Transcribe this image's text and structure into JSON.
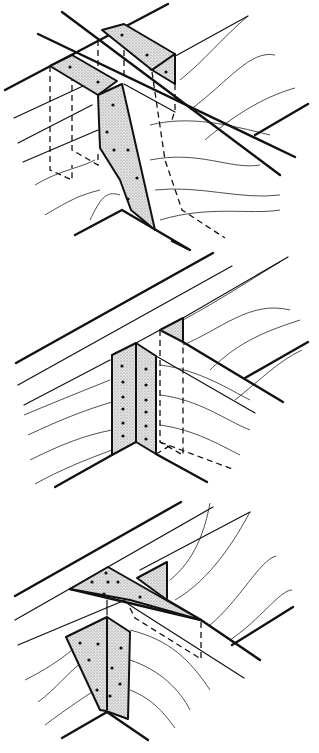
{
  "figure": {
    "colors": {
      "line": "#111111",
      "plate_fill": "#d8d8d8",
      "background": "#ffffff"
    },
    "panels": [
      {
        "name": "joist-hanger-detail",
        "label": "",
        "plates": [
          "M50,66 L72,55 L117,81 L98,95 Z",
          "M102,30 L124,24 L175,54 L152,70 Z",
          "M152,70 L175,54 L175,84 Z",
          "M98,95 L122,84 L155,230 L131,210 L120,180 L100,148 Z"
        ],
        "nails": [
          [
            70,
            67
          ],
          [
            98,
            82
          ],
          [
            122,
            35
          ],
          [
            147,
            55
          ],
          [
            166,
            72
          ],
          [
            113,
            105
          ],
          [
            107,
            132
          ],
          [
            114,
            150
          ],
          [
            128,
            150
          ],
          [
            137,
            178
          ],
          [
            128,
            199
          ]
        ],
        "thick_lines": [
          "M5,90 L168,4",
          "M38,34 L295,157",
          "M62,12 L280,175",
          "M255,135 L308,104",
          "M75,235 L122,210 L190,250"
        ],
        "thin_lines": [
          "M14,118 L96,80",
          "M18,143 L92,105",
          "M23,162 L98,130",
          "M150,70 L248,16",
          "M124,84 L175,112"
        ],
        "dashed_lines": [
          "M50,66 L50,170 L72,180 L72,165",
          "M72,55 L72,150 L98,165 L98,150",
          "M98,40 L98,90",
          "M124,30 L124,80",
          "M152,72 L165,160 L182,210 L225,238",
          "M175,84 L175,110 L172,120"
        ],
        "grain_lines": [
          "M180,80 C205,60 220,40 248,16",
          "M190,110 C230,80 250,50 275,55",
          "M205,140 C240,110 270,95 295,88",
          "M150,125 C190,115 230,125 270,135",
          "M150,160 C200,150 230,170 260,165",
          "M155,190 C200,185 240,200 280,195",
          "M160,220 C210,205 250,215 280,210",
          "M90,220 C100,200 105,190 120,195",
          "M35,185 C60,170 80,168 95,160",
          "M45,215 C70,200 80,195 100,190"
        ]
      },
      {
        "name": "angle-connector-detail",
        "label": "",
        "plates": [
          "M112,355 L136,343 L136,442 L112,455 Z",
          "M136,343 L156,356 L156,454 L136,442 Z",
          "M160,330 L183,318 L183,342 Z"
        ],
        "nails": [
          [
            122,
            366
          ],
          [
            123,
            382
          ],
          [
            123,
            397
          ],
          [
            123,
            409
          ],
          [
            123,
            423
          ],
          [
            123,
            436
          ],
          [
            146,
            369
          ],
          [
            146,
            385
          ],
          [
            146,
            400
          ],
          [
            146,
            412
          ],
          [
            146,
            426
          ],
          [
            146,
            439
          ]
        ],
        "thick_lines": [
          "M16,363 L213,253",
          "M245,378 L308,342",
          "M55,487 L112,455",
          "M156,454 L207,482",
          "M183,342 L283,402",
          "M172,241 L188,249"
        ],
        "thin_lines": [
          "M18,385 L232,266",
          "M24,405 L110,360",
          "M136,343 L160,330 L183,318 L288,257",
          "M156,356 L255,413"
        ],
        "dashed_lines": [
          "M160,330 L160,442 L183,455 L183,342",
          "M160,442 L235,470",
          "M156,454 L173,444"
        ],
        "grain_lines": [
          "M183,320 C220,300 250,280 280,262",
          "M183,345 C220,330 250,300 290,310",
          "M210,370 C240,340 270,330 300,320",
          "M235,400 C260,380 280,360 302,350",
          "M160,365 C200,370 230,390 250,400",
          "M160,395 C200,400 225,420 250,430",
          "M160,425 C195,430 220,445 240,455",
          "M24,415 C60,400 85,390 110,380",
          "M28,435 C60,420 85,410 112,402",
          "M30,460 C60,445 85,435 112,430",
          "M35,484 C60,470 85,460 112,450"
        ]
      },
      {
        "name": "gusset-plate-detail",
        "label": "",
        "plates": [
          "M70,589 L108,567 L201,620 L130,600 Z",
          "M137,578 L167,562 L167,600 Z",
          "M66,637 L107,617 L130,632 L128,719 L106,711 L100,710 Z",
          "M107,617 L107,710"
        ],
        "nails": [
          [
            92,
            582
          ],
          [
            106,
            573
          ],
          [
            108,
            582
          ],
          [
            118,
            582
          ],
          [
            104,
            594
          ],
          [
            140,
            597
          ],
          [
            80,
            643
          ],
          [
            98,
            644
          ],
          [
            121,
            648
          ],
          [
            112,
            668
          ],
          [
            89,
            660
          ],
          [
            97,
            690
          ],
          [
            120,
            684
          ],
          [
            110,
            696
          ]
        ],
        "thick_lines": [
          "M15,596 L181,502",
          "M232,645 L293,607",
          "M62,738 L107,712 L148,740",
          "M167,600 L201,620 L260,660",
          "M70,589 L201,620"
        ],
        "thin_lines": [
          "M15,620 L213,507",
          "M18,645 L130,598",
          "M140,570 L250,512",
          "M107,600 L107,615",
          "M128,604 L244,678"
        ],
        "dashed_lines": [
          "M130,608 L135,618 L201,659 L201,620"
        ],
        "grain_lines": [
          "M170,580 C195,560 205,530 210,503",
          "M175,600 C210,580 235,540 250,512",
          "M210,625 C240,600 260,560 276,556",
          "M230,640 C260,620 280,590 292,590",
          "M130,630 C170,640 190,660 210,690",
          "M130,660 C160,670 180,690 190,710",
          "M130,690 C155,700 165,715 175,728",
          "M25,680 C45,670 60,660 72,650",
          "M38,702 C55,690 70,670 85,660",
          "M45,725 C65,710 80,700 95,690"
        ]
      }
    ]
  }
}
